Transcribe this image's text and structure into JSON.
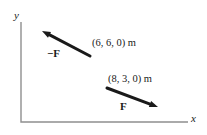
{
  "figure": {
    "y_axis_label": "y",
    "x_axis_label": "x",
    "vectors": [
      {
        "label": "−F",
        "point_label": "(6, 6, 0) m"
      },
      {
        "label": "F",
        "point_label": "(8, 3, 0) m"
      }
    ],
    "colors": {
      "vector": "#1a1a1a",
      "axis": "#8f8f8f",
      "text": "#1a1a1a",
      "background": "#ffffff"
    }
  }
}
